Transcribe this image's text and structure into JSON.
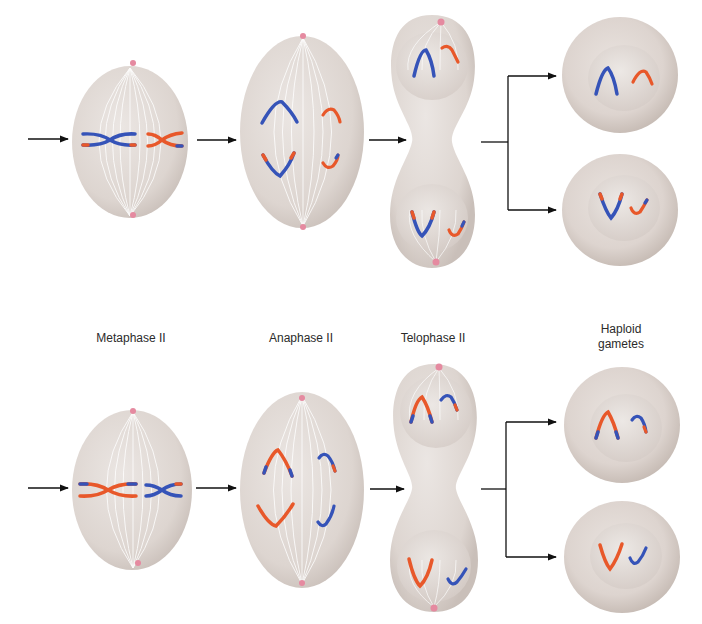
{
  "diagram": {
    "type": "biology-process",
    "stages": [
      {
        "id": "metaphase",
        "label": "Metaphase II"
      },
      {
        "id": "anaphase",
        "label": "Anaphase II"
      },
      {
        "id": "telophase",
        "label": "Telophase II"
      },
      {
        "id": "gametes",
        "label": "Haploid\ngametes",
        "label_line1": "Haploid",
        "label_line2": "gametes"
      }
    ],
    "rows": [
      {
        "id": "row-top",
        "large_chromosome_color": "blue",
        "small_chromosome_color": "orange"
      },
      {
        "id": "row-bottom",
        "large_chromosome_color": "orange",
        "small_chromosome_color": "blue"
      }
    ],
    "colors": {
      "cell_fill": "#e7e1dd",
      "cell_shade": "#cfc6c0",
      "spindle": "#ffffff",
      "centrosome": "#e58aa0",
      "chromosome_blue": "#3553b8",
      "chromosome_orange": "#e8582a",
      "arrow": "#111111",
      "label_text": "#2b2b2b"
    }
  }
}
